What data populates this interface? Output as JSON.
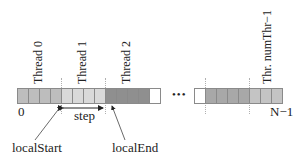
{
  "diagram": {
    "thread_labels": [
      "Thread 0",
      "Thread 1",
      "Thread 2",
      "Thr. numThr−1"
    ],
    "index_start": "0",
    "index_end": "N−1",
    "ellipsis": "•••",
    "step_label": "step",
    "local_start_label": "localStart",
    "local_end_label": "localEnd",
    "colors": {
      "thread0": "#bdbdbd",
      "thread1": "#d9d9d9",
      "thread2": "#8f8f8f",
      "last_thread": "#a8a8a8",
      "last_thread_light": "#c4c4c4",
      "empty": "#ffffff",
      "border": "#8a8a8a"
    }
  }
}
